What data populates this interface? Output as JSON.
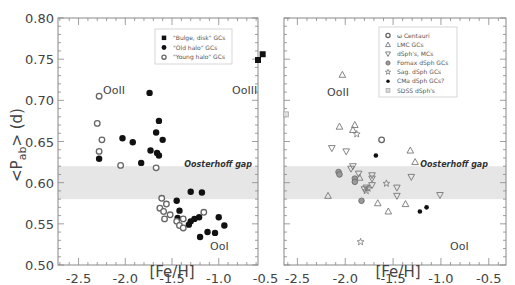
{
  "chart_data": [
    {
      "type": "scatter",
      "title": "",
      "xlabel": "[Fe/H]",
      "ylabel": "<P_ab> (d)",
      "xlim": [
        -2.72,
        -0.58
      ],
      "ylim": [
        0.5,
        0.8
      ],
      "xticks": [
        "-2.5",
        "-2.0",
        "-1.5",
        "-1.0",
        "-0.5"
      ],
      "yticks": [
        "0.80",
        "0.75",
        "0.70",
        "0.65",
        "0.60",
        "0.55",
        "0.50"
      ],
      "grid": false,
      "legend_position": "upper right",
      "band": {
        "label": "Oosterhoff gap",
        "y0": 0.58,
        "y1": 0.62
      },
      "annotations": [
        {
          "text": "OoII",
          "x": -2.05,
          "y": 0.695
        },
        {
          "text": "OoIII",
          "x": -0.65,
          "y": 0.695
        },
        {
          "text": "OoI",
          "x": -1.0,
          "y": 0.525
        }
      ],
      "series": [
        {
          "name": "\"Bulge, disk\" GCs",
          "marker": "square-filled",
          "points": [
            [
              -0.58,
              0.749
            ],
            [
              -0.53,
              0.756
            ]
          ]
        },
        {
          "name": "\"Old halo\" GCs",
          "marker": "circle-filled",
          "points": [
            [
              -2.28,
              0.629
            ],
            [
              -2.03,
              0.654
            ],
            [
              -1.92,
              0.649
            ],
            [
              -1.74,
              0.709
            ],
            [
              -1.67,
              0.661
            ],
            [
              -1.64,
              0.675
            ],
            [
              -1.6,
              0.652
            ],
            [
              -1.73,
              0.639
            ],
            [
              -1.66,
              0.636
            ],
            [
              -1.83,
              0.624
            ],
            [
              -1.64,
              0.633
            ],
            [
              -1.3,
              0.589
            ],
            [
              -1.18,
              0.588
            ],
            [
              -1.45,
              0.578
            ],
            [
              -1.42,
              0.566
            ],
            [
              -1.44,
              0.557
            ],
            [
              -1.3,
              0.553
            ],
            [
              -1.32,
              0.549
            ],
            [
              -1.26,
              0.556
            ],
            [
              -1.21,
              0.558
            ],
            [
              -1.0,
              0.558
            ],
            [
              -0.94,
              0.548
            ],
            [
              -1.2,
              0.534
            ],
            [
              -1.12,
              0.54
            ],
            [
              -1.04,
              0.539
            ]
          ]
        },
        {
          "name": "\"Young halo\" GCs",
          "marker": "circle-open",
          "points": [
            [
              -2.28,
              0.705
            ],
            [
              -2.3,
              0.672
            ],
            [
              -2.25,
              0.652
            ],
            [
              -2.28,
              0.638
            ],
            [
              -2.05,
              0.621
            ],
            [
              -1.67,
              0.618
            ],
            [
              -1.61,
              0.581
            ],
            [
              -1.56,
              0.574
            ],
            [
              -1.63,
              0.569
            ],
            [
              -1.59,
              0.565
            ],
            [
              -1.58,
              0.556
            ],
            [
              -1.52,
              0.561
            ],
            [
              -1.45,
              0.553
            ],
            [
              -1.42,
              0.548
            ],
            [
              -1.38,
              0.545
            ],
            [
              -1.38,
              0.556
            ],
            [
              -1.16,
              0.564
            ]
          ]
        }
      ]
    },
    {
      "type": "scatter",
      "title": "",
      "xlabel": "[Fe/H]",
      "ylabel": "",
      "xlim": [
        -2.64,
        -0.32
      ],
      "ylim": [
        0.5,
        0.8
      ],
      "xticks": [
        "-2.5",
        "-2.0",
        "-1.5",
        "-1.0",
        "-0.5"
      ],
      "yticks": [
        "0.80",
        "0.75",
        "0.70",
        "0.65",
        "0.60",
        "0.55",
        "0.50"
      ],
      "grid": false,
      "legend_position": "upper right",
      "band": {
        "label": "Oosterhoff gap",
        "y0": 0.58,
        "y1": 0.62
      },
      "annotations": [
        {
          "text": "OoII",
          "x": -1.98,
          "y": 0.695
        },
        {
          "text": "OoI",
          "x": -1.05,
          "y": 0.525
        }
      ],
      "series": [
        {
          "name": "ω Centauri",
          "marker": "circle-open",
          "points": [
            [
              -1.62,
              0.652
            ]
          ]
        },
        {
          "name": "LMC GCs",
          "marker": "triangle-up-open",
          "points": [
            [
              -2.03,
              0.731
            ],
            [
              -2.06,
              0.668
            ],
            [
              -1.9,
              0.67
            ],
            [
              -1.92,
              0.664
            ],
            [
              -2.18,
              0.584
            ],
            [
              -1.85,
              0.606
            ],
            [
              -1.66,
              0.575
            ],
            [
              -1.55,
              0.565
            ],
            [
              -1.37,
              0.574
            ],
            [
              -1.32,
              0.639
            ],
            [
              -1.27,
              0.625
            ]
          ]
        },
        {
          "name": "dSph's, MCs",
          "marker": "triangle-down-open",
          "points": [
            [
              -2.14,
              0.642
            ],
            [
              -1.99,
              0.638
            ],
            [
              -1.92,
              0.62
            ],
            [
              -1.94,
              0.617
            ],
            [
              -1.86,
              0.611
            ],
            [
              -1.72,
              0.609
            ],
            [
              -1.72,
              0.605
            ],
            [
              -1.72,
              0.597
            ],
            [
              -1.78,
              0.594
            ],
            [
              -1.46,
              0.594
            ],
            [
              -1.46,
              0.584
            ],
            [
              -1.31,
              0.607
            ],
            [
              -1.01,
              0.585
            ],
            [
              -1.8,
              0.592
            ]
          ]
        },
        {
          "name": "Fornax dSph GCs",
          "marker": "diamond-filled-gray",
          "points": [
            [
              -2.07,
              0.613
            ],
            [
              -2.06,
              0.61
            ],
            [
              -1.9,
              0.605
            ],
            [
              -1.9,
              0.601
            ],
            [
              -1.83,
              0.578
            ]
          ]
        },
        {
          "name": "Sag. dSph GCs",
          "marker": "star-open",
          "points": [
            [
              -1.88,
              0.659
            ],
            [
              -1.57,
              0.599
            ],
            [
              -1.76,
              0.593
            ],
            [
              -1.84,
              0.528
            ],
            [
              -1.78,
              0.59
            ]
          ]
        },
        {
          "name": "CMa dSph GCs?",
          "marker": "circle-filled-small",
          "points": [
            [
              -1.68,
              0.633
            ],
            [
              -1.22,
              0.565
            ],
            [
              -1.15,
              0.57
            ]
          ]
        },
        {
          "name": "SDSS dSph's",
          "marker": "square-open-gray",
          "points": [
            [
              -2.62,
              0.683
            ]
          ]
        }
      ]
    }
  ],
  "panels": {
    "left": {
      "y_axis_title_main": "<P",
      "y_axis_title_sub": "ab",
      "y_axis_title_tail": "> (d)",
      "x_axis_title": "[Fe/H]",
      "gap_label": "Oosterhoff gap",
      "regions": [
        "OoII",
        "OoIII",
        "OoI"
      ],
      "legend": [
        "\"Bulge, disk\" GCs",
        "\"Old halo\" GCs",
        "\"Young halo\" GCs"
      ]
    },
    "right": {
      "x_axis_title": "[Fe/H]",
      "gap_label": "Oosterhoff gap",
      "regions": [
        "OoII",
        "OoI"
      ],
      "legend": [
        "ω Centauri",
        "LMC GCs",
        "dSph's, MCs",
        "Fornax dSph GCs",
        "Sag. dSph GCs",
        "CMa dSph GCs?",
        "SDSS dSph's"
      ]
    }
  },
  "colors": {
    "band": "#e6e6e6",
    "axis": "#888888",
    "marker_dark": "#111111",
    "marker_gray": "#888888"
  }
}
